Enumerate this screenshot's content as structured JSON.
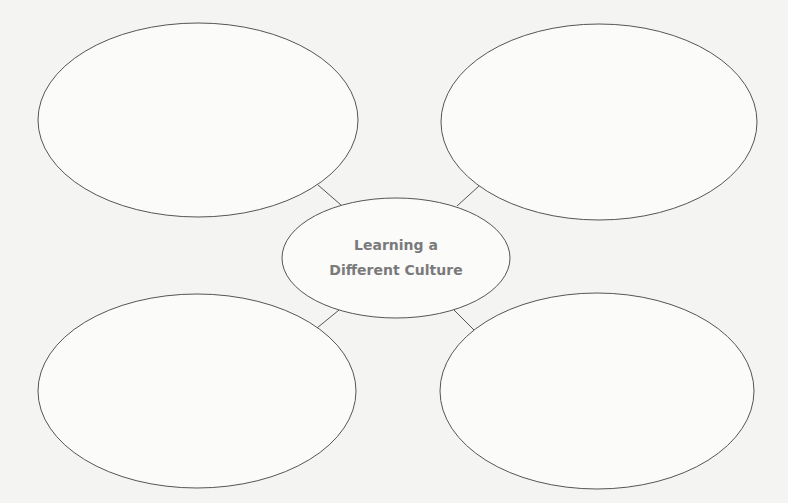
{
  "diagram": {
    "type": "web organizer",
    "center": {
      "line1": "Learning a",
      "line2": "Different Culture"
    },
    "branches": [
      {
        "position": "top-left",
        "text": ""
      },
      {
        "position": "top-right",
        "text": ""
      },
      {
        "position": "bottom-left",
        "text": ""
      },
      {
        "position": "bottom-right",
        "text": ""
      }
    ],
    "colors": {
      "stroke": "#555555",
      "text": "#7a7a7a",
      "background": "#f4f4f2"
    }
  }
}
